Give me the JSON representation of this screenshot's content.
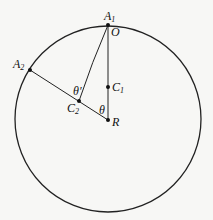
{
  "diagram": {
    "circle": {
      "cx": 108,
      "cy": 119,
      "r": 93
    },
    "points": {
      "A1": {
        "label": "A",
        "sub": "1",
        "x": 108,
        "y": 25
      },
      "O": {
        "label": "O",
        "x": 108,
        "y": 25
      },
      "A2": {
        "label": "A",
        "sub": "2",
        "x": 30,
        "y": 70
      },
      "C1": {
        "label": "C",
        "sub": "1",
        "x": 108,
        "y": 87
      },
      "C2": {
        "label": "C",
        "sub": "2",
        "x": 79,
        "y": 101
      },
      "R": {
        "label": "R",
        "x": 108,
        "y": 120
      }
    },
    "angles": {
      "theta": "θ",
      "theta_prime": "θ′"
    },
    "colors": {
      "line": "#222222",
      "background": "#f7f7f5"
    }
  }
}
